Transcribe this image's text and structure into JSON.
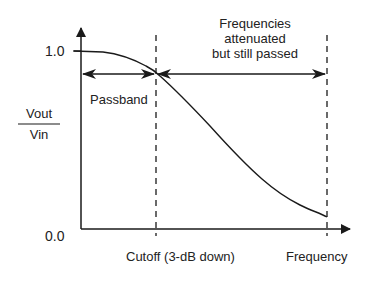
{
  "diagram": {
    "type": "low-pass filter frequency response",
    "y_axis": {
      "label_numerator": "Vout",
      "label_denominator": "Vin",
      "ticks": [
        "1.0",
        "0.0"
      ]
    },
    "x_axis": {
      "label": "Frequency",
      "cutoff_label": "Cutoff (3-dB down)"
    },
    "regions": {
      "passband": "Passband",
      "attenuated_line1": "Frequencies",
      "attenuated_line2": "attenuated",
      "attenuated_line3": "but still passed"
    },
    "colors": {
      "line": "#1a1a1a",
      "background": "#ffffff"
    }
  }
}
